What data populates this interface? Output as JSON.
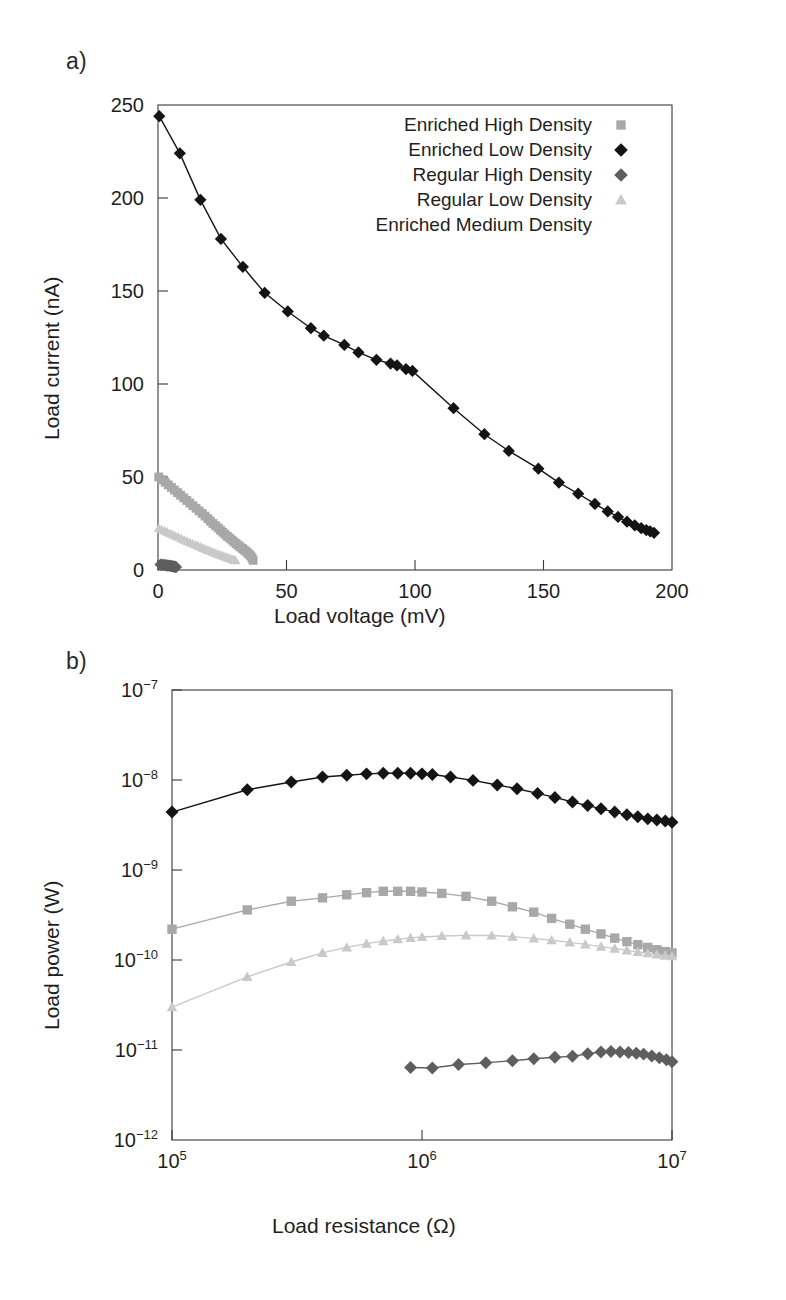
{
  "figure": {
    "panel_a_label": "a)",
    "panel_b_label": "b)"
  },
  "legend": {
    "position": "inside-top-right-panel-a",
    "entries": [
      {
        "label": "Enriched High Density",
        "marker": "square",
        "color": "#a8a8a8"
      },
      {
        "label": "Enriched Low Density",
        "marker": "diamond",
        "color": "#141414"
      },
      {
        "label": "Regular High Density",
        "marker": "diamond",
        "color": "#5e5e5e"
      },
      {
        "label": "Regular Low Density",
        "marker": "triangle",
        "color": "#c9c9c9"
      },
      {
        "label": "Enriched Medium Density",
        "marker": "none",
        "color": "#ffffff"
      }
    ]
  },
  "chart_data": [
    {
      "type": "scatter",
      "panel": "a",
      "title": "",
      "xlabel": "Load voltage (mV)",
      "ylabel": "Load current (nA)",
      "xlim": [
        0,
        200
      ],
      "ylim": [
        0,
        250
      ],
      "xticks": [
        0,
        50,
        100,
        150,
        200
      ],
      "xtick_labels": [
        "0",
        "50",
        "100",
        "150",
        "200"
      ],
      "yticks": [
        0,
        50,
        100,
        150,
        200,
        250
      ],
      "ytick_labels": [
        "0",
        "50",
        "100",
        "150",
        "200",
        "250"
      ],
      "xscale": "linear",
      "yscale": "linear",
      "grid": false,
      "series": [
        {
          "name": "Enriched Low Density",
          "marker": "diamond",
          "color": "#141414",
          "line": true,
          "x": [
            0.5,
            8.5,
            16.5,
            24.5,
            33.0,
            41.5,
            50.5,
            59.5,
            64.5,
            72.5,
            78.0,
            85.0,
            90.5,
            93.0,
            96.5,
            99.0,
            115.0,
            127.0,
            136.5,
            148.0,
            156.0,
            163.5,
            170.0,
            175.0,
            179.0,
            182.5,
            185.5,
            188.0,
            190.0,
            191.5,
            193.0
          ],
          "y": [
            244.0,
            224.0,
            199.0,
            178.0,
            163.0,
            149.0,
            139.0,
            130.0,
            126.0,
            121.0,
            117.0,
            113.0,
            111.0,
            110.0,
            108.0,
            107.0,
            87.0,
            73.0,
            64.0,
            54.5,
            47.0,
            41.0,
            35.5,
            31.5,
            28.5,
            26.0,
            24.0,
            22.5,
            21.5,
            20.8,
            20.0
          ]
        },
        {
          "name": "Enriched High Density",
          "marker": "square",
          "color": "#a8a8a8",
          "line": false,
          "x": [
            0.3,
            1.6,
            2.8,
            4.0,
            5.2,
            6.4,
            7.6,
            8.8,
            10.0,
            11.2,
            12.4,
            13.6,
            14.8,
            16.0,
            17.2,
            18.3,
            19.4,
            20.4,
            21.4,
            22.4,
            23.4,
            24.3,
            25.2,
            26.1,
            27.0,
            27.9,
            28.8,
            29.6,
            30.4,
            31.2,
            32.0,
            32.8,
            33.5,
            34.2,
            34.9,
            35.5,
            36.1,
            36.6,
            37.0
          ],
          "y": [
            50.0,
            48.6,
            47.2,
            45.8,
            44.4,
            43.0,
            41.6,
            40.2,
            38.8,
            37.4,
            36.0,
            34.6,
            33.2,
            31.8,
            30.4,
            29.0,
            27.6,
            26.3,
            25.0,
            23.8,
            22.6,
            21.4,
            20.3,
            19.2,
            18.1,
            17.1,
            16.1,
            15.1,
            14.2,
            13.3,
            12.4,
            11.6,
            10.8,
            10.0,
            9.2,
            8.4,
            7.5,
            6.5,
            5.2
          ]
        },
        {
          "name": "Regular Low Density",
          "marker": "triangle",
          "color": "#c9c9c9",
          "line": false,
          "x": [
            0.3,
            1.4,
            2.5,
            3.6,
            4.7,
            5.8,
            6.9,
            8.0,
            9.1,
            10.2,
            11.3,
            12.4,
            13.5,
            14.6,
            15.6,
            16.6,
            17.6,
            18.6,
            19.5,
            20.4,
            21.3,
            22.2,
            23.1,
            24.0,
            24.8,
            25.6,
            26.4,
            27.1,
            27.8,
            28.5,
            29.1,
            29.7,
            30.2
          ],
          "y": [
            22.5,
            21.8,
            21.1,
            20.4,
            19.7,
            19.0,
            18.3,
            17.6,
            16.9,
            16.2,
            15.5,
            14.8,
            14.2,
            13.6,
            13.0,
            12.4,
            11.8,
            11.2,
            10.7,
            10.2,
            9.7,
            9.2,
            8.7,
            8.2,
            7.8,
            7.4,
            7.0,
            6.6,
            6.3,
            6.0,
            5.7,
            5.4,
            5.1
          ]
        },
        {
          "name": "Regular High Density",
          "marker": "diamond",
          "color": "#5e5e5e",
          "line": false,
          "x": [
            1.0,
            1.6,
            2.2,
            2.8,
            3.3,
            3.8,
            4.3,
            4.8,
            5.2,
            5.6,
            6.0,
            6.4,
            6.7,
            7.0
          ],
          "y": [
            2.9,
            2.8,
            2.7,
            2.6,
            2.5,
            2.4,
            2.3,
            2.2,
            2.1,
            2.0,
            1.9,
            1.8,
            1.7,
            1.6
          ]
        }
      ]
    },
    {
      "type": "line",
      "panel": "b",
      "title": "",
      "xlabel": "Load resistance (Ω)",
      "ylabel": "Load power (W)",
      "xlim": [
        100000,
        10000000
      ],
      "ylim": [
        1e-12,
        1e-07
      ],
      "xscale": "log",
      "yscale": "log",
      "xticks": [
        100000,
        1000000,
        10000000
      ],
      "xtick_labels": [
        "10^5",
        "10^6",
        "10^7"
      ],
      "yticks": [
        1e-07,
        1e-08,
        1e-09,
        1e-10,
        1e-11,
        1e-12
      ],
      "ytick_labels": [
        "10^-7",
        "10^-8",
        "10^-9",
        "10^-10",
        "10^-11",
        "10^-12"
      ],
      "grid": false,
      "series": [
        {
          "name": "Enriched Low Density",
          "marker": "diamond",
          "color": "#141414",
          "line": true,
          "x": [
            100000,
            200000,
            300000,
            400000,
            500000,
            600000,
            700000,
            800000,
            900000,
            1000000,
            1100000,
            1300000,
            1600000,
            2000000,
            2400000,
            2900000,
            3400000,
            4000000,
            4600000,
            5200000,
            5900000,
            6600000,
            7300000,
            8000000,
            8700000,
            9400000,
            10000000
          ],
          "y": [
            4.4e-09,
            7.8e-09,
            9.5e-09,
            1.08e-08,
            1.13e-08,
            1.17e-08,
            1.19e-08,
            1.19e-08,
            1.19e-08,
            1.17e-08,
            1.15e-08,
            1.08e-08,
            9.9e-09,
            8.8e-09,
            8e-09,
            7.1e-09,
            6.4e-09,
            5.7e-09,
            5.2e-09,
            4.8e-09,
            4.4e-09,
            4.1e-09,
            3.9e-09,
            3.7e-09,
            3.6e-09,
            3.5e-09,
            3.4e-09
          ]
        },
        {
          "name": "Enriched High Density",
          "marker": "square",
          "color": "#a8a8a8",
          "line": true,
          "x": [
            100000,
            200000,
            300000,
            400000,
            500000,
            600000,
            700000,
            800000,
            900000,
            1000000,
            1200000,
            1500000,
            1900000,
            2300000,
            2800000,
            3300000,
            3900000,
            4500000,
            5200000,
            5900000,
            6600000,
            7300000,
            8000000,
            8700000,
            9400000,
            10000000
          ],
          "y": [
            2.2e-10,
            3.6e-10,
            4.5e-10,
            4.9e-10,
            5.3e-10,
            5.6e-10,
            5.8e-10,
            5.8e-10,
            5.8e-10,
            5.7e-10,
            5.5e-10,
            5.1e-10,
            4.5e-10,
            3.9e-10,
            3.4e-10,
            2.9e-10,
            2.5e-10,
            2.2e-10,
            1.95e-10,
            1.75e-10,
            1.6e-10,
            1.48e-10,
            1.38e-10,
            1.3e-10,
            1.24e-10,
            1.2e-10
          ]
        },
        {
          "name": "Regular Low Density",
          "marker": "triangle",
          "color": "#c9c9c9",
          "line": true,
          "x": [
            100000,
            200000,
            300000,
            400000,
            500000,
            600000,
            700000,
            800000,
            900000,
            1000000,
            1200000,
            1500000,
            1900000,
            2300000,
            2800000,
            3300000,
            3900000,
            4500000,
            5200000,
            5900000,
            6600000,
            7300000,
            8000000,
            8700000,
            9400000,
            10000000
          ],
          "y": [
            3e-11,
            6.5e-11,
            9.5e-11,
            1.2e-10,
            1.38e-10,
            1.52e-10,
            1.62e-10,
            1.7e-10,
            1.76e-10,
            1.8e-10,
            1.85e-10,
            1.88e-10,
            1.87e-10,
            1.82e-10,
            1.74e-10,
            1.66e-10,
            1.57e-10,
            1.49e-10,
            1.41e-10,
            1.34e-10,
            1.28e-10,
            1.23e-10,
            1.19e-10,
            1.15e-10,
            1.12e-10,
            1.1e-10
          ]
        },
        {
          "name": "Regular High Density",
          "marker": "diamond",
          "color": "#5e5e5e",
          "line": true,
          "x": [
            900000,
            1100000,
            1400000,
            1800000,
            2300000,
            2800000,
            3400000,
            4000000,
            4600000,
            5200000,
            5700000,
            6200000,
            6700000,
            7200000,
            7700000,
            8300000,
            8900000,
            9500000,
            10000000
          ],
          "y": [
            6.4e-12,
            6.3e-12,
            6.9e-12,
            7.2e-12,
            7.6e-12,
            8e-12,
            8.3e-12,
            8.5e-12,
            9.1e-12,
            9.5e-12,
            9.6e-12,
            9.5e-12,
            9.4e-12,
            9.2e-12,
            9e-12,
            8.6e-12,
            8.2e-12,
            7.8e-12,
            7.4e-12
          ]
        }
      ]
    }
  ]
}
